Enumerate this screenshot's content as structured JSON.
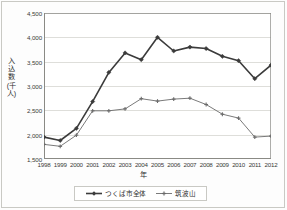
{
  "chart_data": {
    "type": "line",
    "title": "",
    "xlabel": "年",
    "ylabel": "入込数(千人)",
    "ylim": [
      1500,
      4500
    ],
    "ytick_step": 500,
    "grid": true,
    "legend_position": "bottom",
    "categories": [
      "1998",
      "1999",
      "2000",
      "2001",
      "2002",
      "2003",
      "2004",
      "2005",
      "2006",
      "2007",
      "2008",
      "2009",
      "2010",
      "2011",
      "2012"
    ],
    "yticks": [
      "4,500",
      "4,000",
      "3,500",
      "3,000",
      "2,500",
      "2,000",
      "1,500"
    ],
    "ytick_values": [
      4500,
      4000,
      3500,
      3000,
      2500,
      2000,
      1500
    ],
    "series": [
      {
        "name": "つくば市全体",
        "color": "#3b3b3b",
        "marker": "diamond",
        "values": [
          1950,
          1880,
          2130,
          2680,
          3280,
          3680,
          3540,
          4000,
          3720,
          3800,
          3770,
          3610,
          3520,
          3150,
          3430
        ]
      },
      {
        "name": "筑波山",
        "color": "#6b6b6b",
        "marker": "cross",
        "values": [
          1800,
          1760,
          1990,
          2490,
          2490,
          2530,
          2740,
          2690,
          2730,
          2750,
          2620,
          2420,
          2340,
          1950,
          1970
        ]
      }
    ]
  },
  "legend": {
    "entries": [
      {
        "label": "つくば市全体"
      },
      {
        "label": "筑波山"
      }
    ]
  },
  "axes": {
    "y_title": "入込数(千人)",
    "x_title": "年"
  },
  "colors": {
    "series_primary": "#3b3b3b",
    "series_secondary": "#6b6b6b",
    "grid": "#d5d5d0",
    "axis": "#8a8a85",
    "border": "#c9c9c4",
    "background": "#ffffff"
  }
}
